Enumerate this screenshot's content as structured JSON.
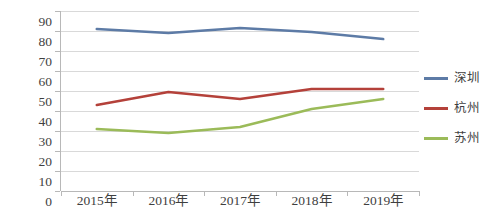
{
  "chart_data": {
    "type": "line",
    "title": "",
    "xlabel": "",
    "ylabel": "",
    "categories": [
      "2015年",
      "2016年",
      "2017年",
      "2018年",
      "2019年"
    ],
    "series": [
      {
        "name": "深圳",
        "color": "#5d7ba6",
        "values": [
          81,
          79,
          81.5,
          79.5,
          76
        ]
      },
      {
        "name": "杭州",
        "color": "#b4413a",
        "values": [
          43,
          49.5,
          46,
          51,
          51
        ]
      },
      {
        "name": "苏州",
        "color": "#9bbb59",
        "values": [
          31,
          29,
          32,
          41,
          46
        ]
      }
    ],
    "ylim": [
      0,
      90
    ],
    "y_ticks": [
      0,
      10,
      20,
      30,
      40,
      50,
      60,
      70,
      80,
      90
    ],
    "y_tick_labels": [
      "0",
      "10",
      "20",
      "30",
      "40",
      "50",
      "60",
      "70",
      "80",
      "90"
    ],
    "grid": true,
    "grid_color": "#d9d9d9",
    "axis_color": "#b8b8b8",
    "legend_position": "right",
    "background": "#ffffff"
  },
  "legend": {
    "items": [
      {
        "label": "深圳"
      },
      {
        "label": "杭州"
      },
      {
        "label": "苏州"
      }
    ]
  }
}
